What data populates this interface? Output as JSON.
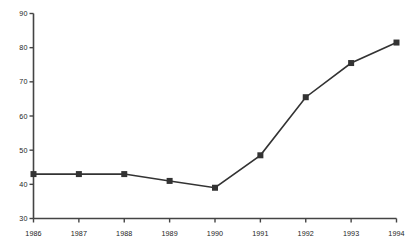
{
  "chart_data": {
    "type": "line",
    "title": "",
    "subtitle": "",
    "xlabel": "",
    "ylabel": "",
    "categories": [
      "1986",
      "1987",
      "1988",
      "1989",
      "1990",
      "1991",
      "1992",
      "1993",
      "1994"
    ],
    "x": [
      1986,
      1987,
      1988,
      1989,
      1990,
      1991,
      1992,
      1993,
      1994
    ],
    "values": [
      43,
      43,
      43,
      41,
      39,
      48.5,
      65.5,
      75.5,
      81.5
    ],
    "series": [
      {
        "name": "series-1",
        "values": [
          43,
          43,
          43,
          41,
          39,
          48.5,
          65.5,
          75.5,
          81.5
        ],
        "color": "#333333",
        "marker": "filled-square",
        "marker_size": 6,
        "line_width": 1.6
      }
    ],
    "ylim": [
      30,
      90
    ],
    "yticks": [
      30,
      40,
      50,
      60,
      70,
      80,
      90
    ],
    "ytick_labels": [
      "30",
      "40",
      "50",
      "60",
      "70",
      "80",
      "90"
    ],
    "xticks": [
      1986,
      1987,
      1988,
      1989,
      1990,
      1991,
      1992,
      1993,
      1994
    ],
    "xtick_labels": [
      "1986",
      "1987",
      "1988",
      "1989",
      "1990",
      "1991",
      "1992",
      "1993",
      "1994"
    ],
    "grid": false,
    "legend": false,
    "legend_position": "none",
    "axis_color": "#444444",
    "tick_direction": "out",
    "background_color": "#ffffff",
    "text_color": "#1c1c1c",
    "annotations": []
  }
}
